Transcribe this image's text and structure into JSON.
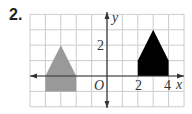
{
  "problem": {
    "number": "2."
  },
  "axes": {
    "x_label": "x",
    "y_label": "y",
    "origin_label": "O",
    "x_tick_labels": [
      {
        "value": 2,
        "text": "2"
      },
      {
        "value": 4,
        "text": "4"
      }
    ],
    "y_tick_labels": [
      {
        "value": 2,
        "text": "2"
      }
    ],
    "x_range": [
      -5,
      5
    ],
    "y_range": [
      -2,
      4
    ]
  },
  "shapes": [
    {
      "name": "preimage",
      "color": "#999999",
      "points": [
        [
          -4,
          -1
        ],
        [
          -4,
          0
        ],
        [
          -3,
          2
        ],
        [
          -2,
          0
        ],
        [
          -2,
          -1
        ]
      ]
    },
    {
      "name": "image",
      "color": "#000000",
      "points": [
        [
          2,
          0
        ],
        [
          2,
          1
        ],
        [
          3,
          3
        ],
        [
          4,
          1
        ],
        [
          4,
          0
        ]
      ]
    }
  ],
  "colors": {
    "grid": "#cccccc",
    "axis": "#333333"
  }
}
